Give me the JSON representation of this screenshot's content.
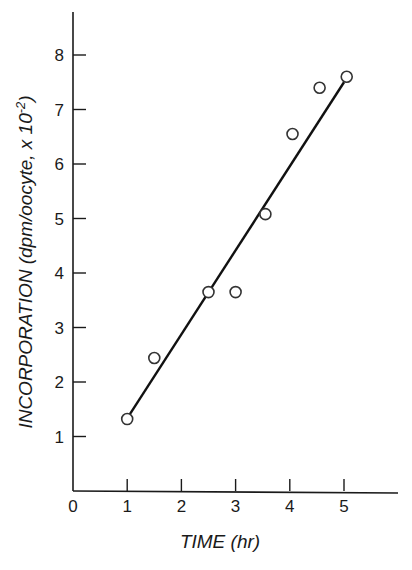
{
  "chart_data": {
    "type": "scatter",
    "title": "",
    "xlabel": "TIME (hr)",
    "ylabel_main": "INCORPORATION (dpm/oocyte, x 10",
    "ylabel_exp": "-2",
    "ylabel_close": ")",
    "ylabel": "INCORPORATION (dpm/oocyte, x 10^-2)",
    "xlim": [
      0,
      6
    ],
    "ylim": [
      0,
      8.8
    ],
    "xticks": [
      0,
      1,
      2,
      3,
      4,
      5
    ],
    "yticks": [
      1,
      2,
      3,
      4,
      5,
      6,
      7,
      8
    ],
    "grid": false,
    "legend": null,
    "series": [
      {
        "name": "observed",
        "marker": "open-circle",
        "x": [
          1.0,
          1.5,
          2.5,
          3.0,
          3.55,
          4.05,
          4.55,
          5.05
        ],
        "y": [
          1.32,
          2.44,
          3.65,
          3.65,
          5.08,
          6.55,
          7.4,
          7.6
        ]
      },
      {
        "name": "linear fit",
        "marker": "none",
        "line": true,
        "x": [
          1.05,
          5.0
        ],
        "y": [
          1.41,
          7.5
        ]
      }
    ]
  }
}
